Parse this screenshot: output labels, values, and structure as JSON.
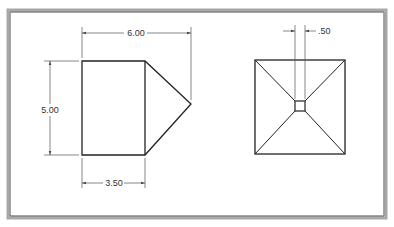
{
  "colors": {
    "background": "#ffffff",
    "frame_shadow": "#9a9a9a",
    "frame_line": "#5a5a5a",
    "object_line": "#222222",
    "dimension_line": "#555555",
    "text": "#333333"
  },
  "front_view": {
    "dimensions": {
      "overall_width": "6.00",
      "height": "5.00",
      "body_width": "3.50"
    }
  },
  "top_view": {
    "dimensions": {
      "apex_width": ".50"
    }
  }
}
